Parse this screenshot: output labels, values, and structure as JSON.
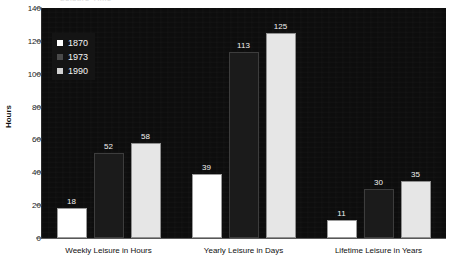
{
  "chart_data": {
    "type": "bar",
    "title": "Leisure Time",
    "categories": [
      "Weekly Leisure in Hours",
      "Yearly Leisure in Days",
      "Lifetime Leisure in Years"
    ],
    "series": [
      {
        "name": "1870",
        "values": [
          18,
          39,
          11
        ],
        "color": "#ffffff"
      },
      {
        "name": "1973",
        "values": [
          52,
          113,
          30
        ],
        "color": "#1b1b1b"
      },
      {
        "name": "1990",
        "values": [
          58,
          125,
          35
        ],
        "color": "#e6e6e6"
      }
    ],
    "xlabel": "",
    "ylabel": "Hours",
    "ylim": [
      0,
      140
    ],
    "yticks": [
      0,
      20,
      40,
      60,
      80,
      100,
      120,
      140
    ],
    "grid": false,
    "legend_position": "top-left",
    "plot_background": "#0d0d0d"
  }
}
